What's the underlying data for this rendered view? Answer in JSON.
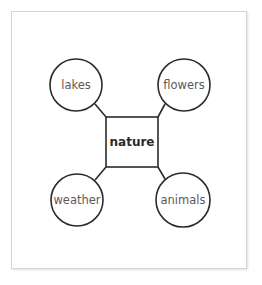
{
  "diagram": {
    "type": "concept-web",
    "center": {
      "label": "nature"
    },
    "nodes": [
      {
        "position": "top-left",
        "label": "lakes"
      },
      {
        "position": "top-right",
        "label": "flowers"
      },
      {
        "position": "bottom-left",
        "label": "weather"
      },
      {
        "position": "bottom-right",
        "label": "animals"
      }
    ]
  },
  "colors": {
    "stroke": "#2b2b2b",
    "node_text": "#5a5a5a",
    "center_text": "#2a2a2a",
    "card_border": "#d4d4d4",
    "background": "#ffffff"
  }
}
